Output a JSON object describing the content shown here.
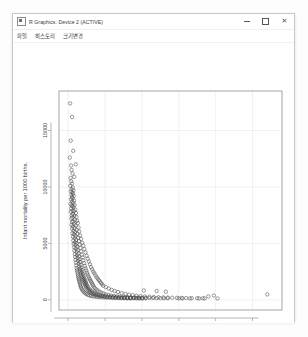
{
  "window": {
    "title": "R Graphics: Device 2 (ACTIVE)",
    "icon": "r-app-icon",
    "controls": {
      "minimize": "minimize-icon",
      "maximize": "maximize-icon",
      "close": "close-icon"
    }
  },
  "menu": {
    "items": [
      {
        "label": "파일"
      },
      {
        "label": "히스토리"
      },
      {
        "label": "크기변경"
      }
    ]
  },
  "colors": {
    "point_stroke": "#4a4a4a",
    "panel_border": "#8f8f8f",
    "gridline": "#e8e8e8",
    "background": "#ffffff"
  },
  "chart_data": {
    "type": "scatter",
    "title": "",
    "xlabel": "GDP...per.capita.",
    "ylabel": "Infant.mortality.per.1000.births.",
    "xlim": [
      -2500,
      58000
    ],
    "ylim": [
      -900,
      18500
    ],
    "xticks": [
      0,
      10000,
      20000,
      30000,
      40000,
      50000
    ],
    "yticks": [
      0,
      5000,
      10000,
      15000
    ],
    "xticklabels": [
      "0",
      "10000",
      "20000",
      "30000",
      "40000",
      "50000"
    ],
    "yticklabels": [
      "0",
      "5000",
      "10000",
      "15000"
    ],
    "grid": true,
    "legend": "none",
    "marker": "open-circle",
    "points": [
      [
        520,
        17400
      ],
      [
        690,
        14100
      ],
      [
        430,
        12600
      ],
      [
        760,
        11900
      ],
      [
        900,
        11500
      ],
      [
        1150,
        11200
      ],
      [
        640,
        10800
      ],
      [
        820,
        10500
      ],
      [
        1010,
        10300
      ],
      [
        560,
        10100
      ],
      [
        1250,
        9950
      ],
      [
        930,
        9800
      ],
      [
        1400,
        9700
      ],
      [
        700,
        9600
      ],
      [
        1100,
        9500
      ],
      [
        1320,
        9400
      ],
      [
        870,
        9300
      ],
      [
        1500,
        9200
      ],
      [
        980,
        9100
      ],
      [
        1180,
        9000
      ],
      [
        760,
        8900
      ],
      [
        1600,
        8800
      ],
      [
        1050,
        8700
      ],
      [
        1380,
        8600
      ],
      [
        620,
        8500
      ],
      [
        1720,
        8400
      ],
      [
        900,
        8350
      ],
      [
        1240,
        8300
      ],
      [
        1450,
        8200
      ],
      [
        800,
        8100
      ],
      [
        1900,
        8000
      ],
      [
        1120,
        7900
      ],
      [
        1550,
        7850
      ],
      [
        700,
        7800
      ],
      [
        2100,
        7700
      ],
      [
        1300,
        7600
      ],
      [
        960,
        7500
      ],
      [
        1680,
        7450
      ],
      [
        2250,
        7350
      ],
      [
        1150,
        7300
      ],
      [
        840,
        7200
      ],
      [
        1820,
        7100
      ],
      [
        2400,
        7000
      ],
      [
        1400,
        6950
      ],
      [
        1030,
        6900
      ],
      [
        2600,
        6800
      ],
      [
        1580,
        6700
      ],
      [
        900,
        6650
      ],
      [
        2050,
        6600
      ],
      [
        1250,
        6500
      ],
      [
        2800,
        6400
      ],
      [
        1700,
        6350
      ],
      [
        1050,
        6300
      ],
      [
        2300,
        6200
      ],
      [
        1450,
        6100
      ],
      [
        3000,
        6050
      ],
      [
        1880,
        6000
      ],
      [
        1150,
        5900
      ],
      [
        2500,
        5850
      ],
      [
        1600,
        5800
      ],
      [
        3200,
        5700
      ],
      [
        2000,
        5650
      ],
      [
        1280,
        5600
      ],
      [
        2700,
        5500
      ],
      [
        1750,
        5450
      ],
      [
        3500,
        5400
      ],
      [
        2150,
        5300
      ],
      [
        1380,
        5250
      ],
      [
        2900,
        5200
      ],
      [
        1850,
        5100
      ],
      [
        3800,
        5050
      ],
      [
        2300,
        5000
      ],
      [
        1480,
        4950
      ],
      [
        3100,
        4900
      ],
      [
        1980,
        4850
      ],
      [
        4100,
        4800
      ],
      [
        2450,
        4700
      ],
      [
        1580,
        4650
      ],
      [
        3300,
        4600
      ],
      [
        2100,
        4550
      ],
      [
        4400,
        4500
      ],
      [
        2600,
        4400
      ],
      [
        1680,
        4350
      ],
      [
        3500,
        4300
      ],
      [
        2250,
        4250
      ],
      [
        4700,
        4200
      ],
      [
        2750,
        4100
      ],
      [
        1780,
        4050
      ],
      [
        3700,
        4000
      ],
      [
        2400,
        3950
      ],
      [
        5000,
        3900
      ],
      [
        2900,
        3850
      ],
      [
        1880,
        3800
      ],
      [
        3900,
        3750
      ],
      [
        2550,
        3700
      ],
      [
        5300,
        3650
      ],
      [
        3050,
        3600
      ],
      [
        1980,
        3550
      ],
      [
        4100,
        3500
      ],
      [
        2700,
        3450
      ],
      [
        5600,
        3400
      ],
      [
        3200,
        3350
      ],
      [
        2080,
        3300
      ],
      [
        4300,
        3250
      ],
      [
        2850,
        3200
      ],
      [
        5900,
        3150
      ],
      [
        3350,
        3100
      ],
      [
        2180,
        3050
      ],
      [
        4500,
        3000
      ],
      [
        3000,
        2950
      ],
      [
        6200,
        2900
      ],
      [
        3500,
        2850
      ],
      [
        2280,
        2800
      ],
      [
        4700,
        2780
      ],
      [
        3150,
        2750
      ],
      [
        6500,
        2700
      ],
      [
        3650,
        2650
      ],
      [
        2380,
        2620
      ],
      [
        4900,
        2600
      ],
      [
        3300,
        2550
      ],
      [
        6800,
        2500
      ],
      [
        3800,
        2480
      ],
      [
        2480,
        2450
      ],
      [
        5100,
        2400
      ],
      [
        3450,
        2380
      ],
      [
        7100,
        2350
      ],
      [
        3950,
        2300
      ],
      [
        2580,
        2280
      ],
      [
        5300,
        2250
      ],
      [
        3600,
        2200
      ],
      [
        7400,
        2180
      ],
      [
        4100,
        2150
      ],
      [
        2680,
        2100
      ],
      [
        5500,
        2080
      ],
      [
        3750,
        2050
      ],
      [
        7700,
        2000
      ],
      [
        4250,
        1980
      ],
      [
        2780,
        1950
      ],
      [
        5700,
        1920
      ],
      [
        3900,
        1900
      ],
      [
        8000,
        1880
      ],
      [
        4400,
        1850
      ],
      [
        2880,
        1820
      ],
      [
        5900,
        1800
      ],
      [
        4050,
        1780
      ],
      [
        8300,
        1750
      ],
      [
        4550,
        1720
      ],
      [
        2980,
        1700
      ],
      [
        6100,
        1680
      ],
      [
        4200,
        1650
      ],
      [
        8600,
        1620
      ],
      [
        4700,
        1600
      ],
      [
        3080,
        1580
      ],
      [
        6300,
        1550
      ],
      [
        4350,
        1520
      ],
      [
        8900,
        1500
      ],
      [
        4850,
        1480
      ],
      [
        3180,
        1450
      ],
      [
        6500,
        1420
      ],
      [
        4500,
        1400
      ],
      [
        9200,
        1380
      ],
      [
        5000,
        1350
      ],
      [
        3280,
        1330
      ],
      [
        6700,
        1300
      ],
      [
        4650,
        1280
      ],
      [
        9500,
        1250
      ],
      [
        5150,
        1230
      ],
      [
        3380,
        1200
      ],
      [
        6900,
        1180
      ],
      [
        4800,
        1150
      ],
      [
        10200,
        1120
      ],
      [
        5400,
        1100
      ],
      [
        3500,
        1080
      ],
      [
        7200,
        1050
      ],
      [
        5000,
        1020
      ],
      [
        11000,
        1000
      ],
      [
        5700,
        980
      ],
      [
        3700,
        950
      ],
      [
        7600,
        930
      ],
      [
        5300,
        900
      ],
      [
        11800,
        880
      ],
      [
        6000,
        860
      ],
      [
        3900,
        840
      ],
      [
        8000,
        820
      ],
      [
        5600,
        800
      ],
      [
        12600,
        780
      ],
      [
        6400,
        760
      ],
      [
        4100,
        740
      ],
      [
        8500,
        720
      ],
      [
        5900,
        700
      ],
      [
        13500,
        690
      ],
      [
        6800,
        670
      ],
      [
        4400,
        650
      ],
      [
        9000,
        640
      ],
      [
        6300,
        620
      ],
      [
        14500,
        600
      ],
      [
        7200,
        590
      ],
      [
        4700,
        570
      ],
      [
        9600,
        560
      ],
      [
        6700,
        540
      ],
      [
        15500,
        530
      ],
      [
        7700,
        510
      ],
      [
        5000,
        500
      ],
      [
        10200,
        490
      ],
      [
        7100,
        470
      ],
      [
        16500,
        460
      ],
      [
        8200,
        450
      ],
      [
        5400,
        440
      ],
      [
        10900,
        430
      ],
      [
        7600,
        420
      ],
      [
        17500,
        410
      ],
      [
        8800,
        400
      ],
      [
        5800,
        390
      ],
      [
        11600,
        380
      ],
      [
        8100,
        370
      ],
      [
        18500,
        360
      ],
      [
        9400,
        350
      ],
      [
        6200,
        345
      ],
      [
        12400,
        340
      ],
      [
        8700,
        330
      ],
      [
        19600,
        325
      ],
      [
        10000,
        315
      ],
      [
        6700,
        310
      ],
      [
        13200,
        305
      ],
      [
        9300,
        300
      ],
      [
        20800,
        295
      ],
      [
        10700,
        290
      ],
      [
        7200,
        285
      ],
      [
        14000,
        280
      ],
      [
        9900,
        275
      ],
      [
        22000,
        270
      ],
      [
        11400,
        265
      ],
      [
        7800,
        260
      ],
      [
        15000,
        255
      ],
      [
        10600,
        250
      ],
      [
        23200,
        245
      ],
      [
        12200,
        240
      ],
      [
        8400,
        238
      ],
      [
        16000,
        235
      ],
      [
        11300,
        230
      ],
      [
        24500,
        228
      ],
      [
        13000,
        225
      ],
      [
        9000,
        222
      ],
      [
        17000,
        220
      ],
      [
        12000,
        218
      ],
      [
        25800,
        215
      ],
      [
        13800,
        212
      ],
      [
        9700,
        210
      ],
      [
        18000,
        208
      ],
      [
        12800,
        205
      ],
      [
        27000,
        200
      ],
      [
        14600,
        198
      ],
      [
        10400,
        196
      ],
      [
        19000,
        194
      ],
      [
        13600,
        192
      ],
      [
        28200,
        190
      ],
      [
        15400,
        188
      ],
      [
        11200,
        186
      ],
      [
        20000,
        184
      ],
      [
        14400,
        182
      ],
      [
        29500,
        180
      ],
      [
        16200,
        178
      ],
      [
        12000,
        176
      ],
      [
        21000,
        174
      ],
      [
        15200,
        172
      ],
      [
        30800,
        170
      ],
      [
        17000,
        168
      ],
      [
        12800,
        166
      ],
      [
        22000,
        164
      ],
      [
        16000,
        162
      ],
      [
        32000,
        160
      ],
      [
        17800,
        158
      ],
      [
        13600,
        156
      ],
      [
        23000,
        155
      ],
      [
        16800,
        154
      ],
      [
        33500,
        152
      ],
      [
        18600,
        150
      ],
      [
        14400,
        149
      ],
      [
        24000,
        148
      ],
      [
        17600,
        147
      ],
      [
        35000,
        146
      ],
      [
        19400,
        145
      ],
      [
        15200,
        144
      ],
      [
        25000,
        143
      ],
      [
        18400,
        142
      ],
      [
        36500,
        140
      ],
      [
        20200,
        139
      ],
      [
        16000,
        138
      ],
      [
        26000,
        137
      ],
      [
        19200,
        136
      ],
      [
        38000,
        300
      ],
      [
        21000,
        135
      ],
      [
        16800,
        134
      ],
      [
        27000,
        133
      ],
      [
        20000,
        132
      ],
      [
        30000,
        130
      ],
      [
        31000,
        128
      ],
      [
        33000,
        126
      ],
      [
        35500,
        124
      ],
      [
        37000,
        122
      ],
      [
        39500,
        380
      ],
      [
        40500,
        120
      ],
      [
        54000,
        480
      ],
      [
        1050,
        16200
      ],
      [
        1350,
        13200
      ],
      [
        2050,
        12000
      ],
      [
        1650,
        10900
      ],
      [
        20500,
        830
      ],
      [
        24000,
        780
      ],
      [
        26500,
        720
      ]
    ]
  }
}
